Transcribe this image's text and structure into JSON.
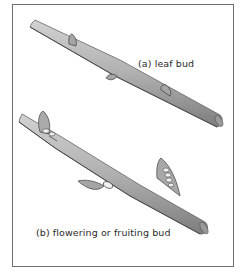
{
  "figure": {
    "panels": [
      {
        "id": "a",
        "caption": "(a) leaf bud",
        "bud_count": 3
      },
      {
        "id": "b",
        "caption": "(b) flowering or fruiting bud",
        "bud_count": 3
      }
    ]
  },
  "colors": {
    "border": "#6e6e6e",
    "branch_fill": "#b3b3b3",
    "branch_shadow": "#7a7a7a",
    "outline": "#3c3c3c",
    "text": "#2a2a2a"
  }
}
